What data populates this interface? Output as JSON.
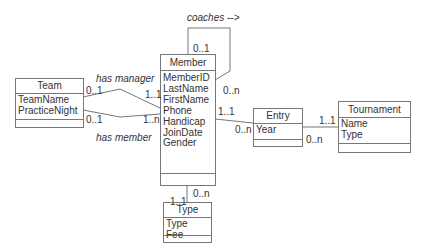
{
  "classes": {
    "team": {
      "name": "Team",
      "attributes": [
        "TeamName",
        "PracticeNight"
      ]
    },
    "member": {
      "name": "Member",
      "attributes": [
        "MemberID",
        "LastName",
        "FirstName",
        "Phone",
        "Handicap",
        "JoinDate",
        "Gender"
      ]
    },
    "entry": {
      "name": "Entry",
      "attributes": [
        "Year"
      ]
    },
    "tournament": {
      "name": "Tournament",
      "attributes": [
        "Name",
        "Type"
      ]
    },
    "type": {
      "name": "Type",
      "attributes": [
        "Type",
        "Fee"
      ]
    }
  },
  "associations": {
    "has_manager": {
      "label": "has manager",
      "team_end": "0..1",
      "member_end": "1..1"
    },
    "has_member": {
      "label": "has member",
      "team_end": "0..1",
      "member_end": "1..n"
    },
    "coaches": {
      "label": "coaches -->",
      "top_end": "0..1",
      "bottom_end": "0..n"
    },
    "member_entry": {
      "member_end": "1..1",
      "entry_end": "0..n"
    },
    "entry_tournament": {
      "tournament_end": "1..1",
      "entry_end": "0..n"
    },
    "member_type": {
      "member_end": "0..n",
      "type_end": "1..1"
    }
  }
}
